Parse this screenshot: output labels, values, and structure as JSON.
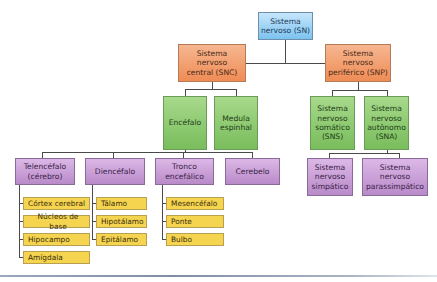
{
  "diagram": {
    "type": "hierarchy",
    "root": {
      "id": "sn",
      "label": "Sistema nervoso (SN)",
      "color": "#7cc3ef"
    },
    "nodes": [
      {
        "id": "sn",
        "label": "Sistema nervoso (SN)",
        "parent": null,
        "color": "blue"
      },
      {
        "id": "snc",
        "label": "Sistema nervoso central (SNC)",
        "parent": "sn",
        "color": "orange"
      },
      {
        "id": "snp",
        "label": "Sistema nervoso periférico (SNP)",
        "parent": "sn",
        "color": "orange"
      },
      {
        "id": "encefalo",
        "label": "Encéfalo",
        "parent": "snc",
        "color": "green"
      },
      {
        "id": "medula",
        "label": "Medula espinhal",
        "parent": "snc",
        "color": "green"
      },
      {
        "id": "sns",
        "label": "Sistema nervoso somático (SNS)",
        "parent": "snp",
        "color": "green"
      },
      {
        "id": "sna",
        "label": "Sistema nervoso autônomo (SNA)",
        "parent": "snp",
        "color": "green"
      },
      {
        "id": "telencefalo",
        "label": "Telencéfalo (cérebro)",
        "parent": "encefalo",
        "color": "purple"
      },
      {
        "id": "diencefalo",
        "label": "Diencéfalo",
        "parent": "encefalo",
        "color": "purple"
      },
      {
        "id": "tronco",
        "label": "Tronco encefálico",
        "parent": "encefalo",
        "color": "purple"
      },
      {
        "id": "cerebelo",
        "label": "Cerebelo",
        "parent": "encefalo",
        "color": "purple"
      },
      {
        "id": "simpatico",
        "label": "Sistema nervoso simpático",
        "parent": "sna",
        "color": "purple"
      },
      {
        "id": "parassimpatico",
        "label": "Sistema nervoso parassimpático",
        "parent": "sna",
        "color": "purple"
      },
      {
        "id": "cortex",
        "label": "Córtex cerebral",
        "parent": "telencefalo",
        "color": "yellow"
      },
      {
        "id": "nucleos",
        "label": "Núcleos de base",
        "parent": "telencefalo",
        "color": "yellow"
      },
      {
        "id": "hipocampo",
        "label": "Hipocampo",
        "parent": "telencefalo",
        "color": "yellow"
      },
      {
        "id": "amigdala",
        "label": "Amígdala",
        "parent": "telencefalo",
        "color": "yellow"
      },
      {
        "id": "talamo",
        "label": "Tálamo",
        "parent": "diencefalo",
        "color": "yellow"
      },
      {
        "id": "hipotalamo",
        "label": "Hipotálamo",
        "parent": "diencefalo",
        "color": "yellow"
      },
      {
        "id": "epitalamo",
        "label": "Epitálamo",
        "parent": "diencefalo",
        "color": "yellow"
      },
      {
        "id": "mesencefalo",
        "label": "Mesencéfalo",
        "parent": "tronco",
        "color": "yellow"
      },
      {
        "id": "ponte",
        "label": "Ponte",
        "parent": "tronco",
        "color": "yellow"
      },
      {
        "id": "bulbo",
        "label": "Bulbo",
        "parent": "tronco",
        "color": "yellow"
      }
    ],
    "colors": {
      "blue": "#7cc3ef",
      "orange": "#ef8c55",
      "green": "#79bd5c",
      "purple": "#b98ac9",
      "yellow": "#f5d44f",
      "line": "#4a4a4a"
    }
  },
  "labels": {
    "sn": [
      "Sistema",
      "nervoso (SN)"
    ],
    "snc": [
      "Sistema",
      "nervoso",
      "central (SNC)"
    ],
    "snp": [
      "Sistema",
      "nervoso",
      "periférico (SNP)"
    ],
    "encefalo": [
      "Encéfalo"
    ],
    "medula": [
      "Medula",
      "espinhal"
    ],
    "sns": [
      "Sistema",
      "nervoso",
      "somático",
      "(SNS)"
    ],
    "sna": [
      "Sistema",
      "nervoso",
      "autônomo",
      "(SNA)"
    ],
    "telencefalo": [
      "Telencéfalo",
      "(cérebro)"
    ],
    "diencefalo": [
      "Diencéfalo"
    ],
    "tronco": [
      "Tronco",
      "encefálico"
    ],
    "cerebelo": [
      "Cerebelo"
    ],
    "simpatico": [
      "Sistema",
      "nervoso",
      "simpático"
    ],
    "parassimpatico": [
      "Sistema",
      "nervoso",
      "parassimpático"
    ],
    "cortex": "Córtex cerebral",
    "nucleos": "Núcleos de base",
    "hipocampo": "Hipocampo",
    "amigdala": "Amígdala",
    "talamo": "Tálamo",
    "hipotalamo": "Hipotálamo",
    "epitalamo": "Epitálamo",
    "mesencefalo": "Mesencéfalo",
    "ponte": "Ponte",
    "bulbo": "Bulbo"
  }
}
